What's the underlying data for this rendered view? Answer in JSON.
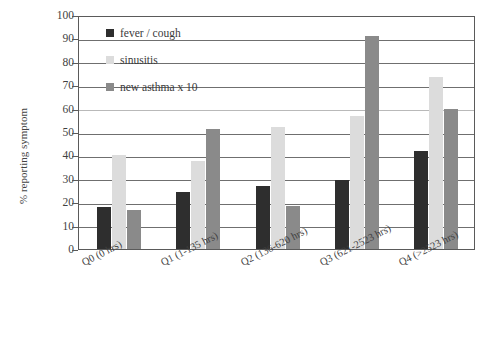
{
  "chart_data": {
    "type": "bar",
    "title": "",
    "xlabel": "",
    "ylabel": "% reporting symptom",
    "ylim": [
      0,
      100
    ],
    "ytick_step": 10,
    "grid": true,
    "legend_position": "inside-top-left",
    "categories": [
      "Q0 (0 hrs)",
      "Q1 (1-135 hrs)",
      "Q2 (136-620 hrs)",
      "Q3 (621-2523 hrs)",
      "Q4 (>2523 hrs)"
    ],
    "yticks": [
      "0",
      "10",
      "20",
      "30",
      "40",
      "50",
      "60",
      "70",
      "80",
      "90",
      "100"
    ],
    "series": [
      {
        "name": "fever / cough",
        "color": "#2e2e2e",
        "values": [
          18,
          24.5,
          27,
          29.5,
          42
        ]
      },
      {
        "name": "sinusitis",
        "color": "#dcdcdc",
        "values": [
          40,
          37.5,
          52,
          57,
          73.5
        ]
      },
      {
        "name": "new asthma x 10",
        "color": "#8a8a8a",
        "values": [
          16.5,
          51.5,
          18.5,
          91,
          60
        ]
      }
    ]
  }
}
